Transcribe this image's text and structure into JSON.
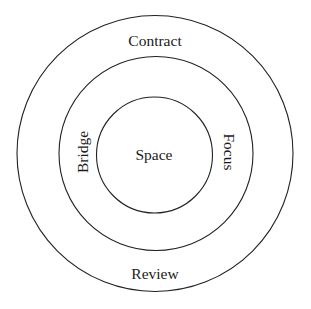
{
  "diagram": {
    "type": "concentric-circles",
    "stroke_color": "#222222",
    "background": "#ffffff",
    "rings": [
      {
        "name": "outer",
        "cx": 155,
        "cy": 153.5,
        "r": 138
      },
      {
        "name": "middle",
        "cx": 156,
        "cy": 153.5,
        "r": 97
      },
      {
        "name": "inner",
        "cx": 154.5,
        "cy": 155,
        "r": 58
      }
    ],
    "labels": {
      "top": "Contract",
      "bottom": "Review",
      "left": "Bridge",
      "right": "Focus",
      "center": "Space"
    }
  }
}
